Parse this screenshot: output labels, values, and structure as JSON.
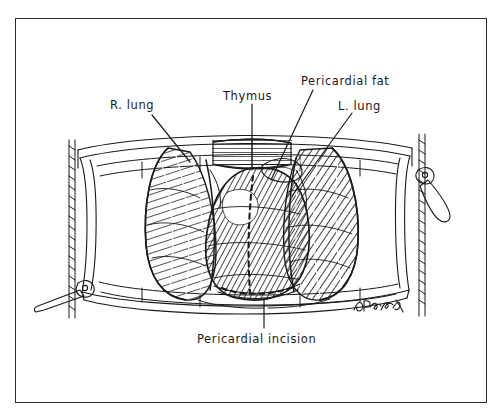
{
  "figure": {
    "medium": "pen-and-ink line drawing",
    "border_color": "#2b2b2b",
    "ink_color": "#1a1a1a",
    "background_color": "#ffffff"
  },
  "labels": {
    "r_lung": "R. lung",
    "thymus": "Thymus",
    "pericardial_fat": "Pericardial fat",
    "l_lung": "L. lung",
    "pericardial_incision": "Pericardial incision"
  },
  "signature": {
    "text": "D.Bickell",
    "style": "cursive-handwritten"
  },
  "anatomy": [
    {
      "name": "right-lung",
      "side": "left-of-image",
      "shading": "curved-hatching"
    },
    {
      "name": "left-lung",
      "side": "right-of-image",
      "shading": "diagonal-hatching"
    },
    {
      "name": "thymus",
      "position": "superior-midline"
    },
    {
      "name": "pericardial-fat",
      "position": "superior-right-paramedian"
    },
    {
      "name": "pericardium",
      "position": "central",
      "shading": "dense-hatching"
    }
  ],
  "instruments": [
    {
      "name": "sternal-retractor-frame",
      "position": "surrounding-field"
    },
    {
      "name": "ratchet-bar-left",
      "position": "left-edge"
    },
    {
      "name": "ratchet-bar-right",
      "position": "right-edge"
    },
    {
      "name": "crank-handle-left",
      "position": "lower-left"
    },
    {
      "name": "crank-handle-right",
      "position": "upper-right"
    }
  ],
  "incision": {
    "type": "inverted-T pericardial incision",
    "rendering": "dashed-line"
  }
}
